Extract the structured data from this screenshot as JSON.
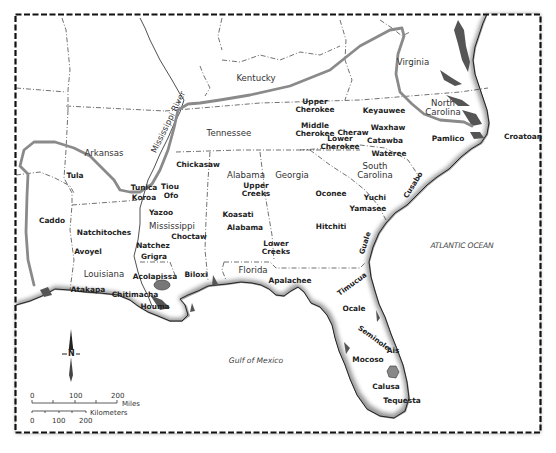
{
  "map": {
    "title": "",
    "states": [
      {
        "id": "kentucky",
        "label": "Kentucky",
        "x": 256,
        "y": 78
      },
      {
        "id": "virginia",
        "label": "Virginia",
        "x": 413,
        "y": 62
      },
      {
        "id": "tennessee",
        "label": "Tennessee",
        "x": 229,
        "y": 133
      },
      {
        "id": "north-carolina",
        "label": "North\nCarolina",
        "x": 443,
        "y": 108
      },
      {
        "id": "arkansas",
        "label": "Arkansas",
        "x": 104,
        "y": 153
      },
      {
        "id": "alabama-state",
        "label": "Alabama",
        "x": 246,
        "y": 175
      },
      {
        "id": "georgia",
        "label": "Georgia",
        "x": 292,
        "y": 175
      },
      {
        "id": "south-carolina",
        "label": "South\nCarolina",
        "x": 375,
        "y": 171
      },
      {
        "id": "mississippi",
        "label": "Mississippi",
        "x": 172,
        "y": 226
      },
      {
        "id": "louisiana",
        "label": "Louisiana",
        "x": 104,
        "y": 274
      },
      {
        "id": "florida-state",
        "label": "Florida",
        "x": 253,
        "y": 270
      }
    ],
    "tribes": [
      {
        "id": "upper-cherokee",
        "label": "Upper\nCherokee",
        "x": 315,
        "y": 106
      },
      {
        "id": "middle-cherokee",
        "label": "Middle\nCherokee",
        "x": 315,
        "y": 130
      },
      {
        "id": "keyauwee",
        "label": "Keyauwee",
        "x": 384,
        "y": 111
      },
      {
        "id": "waxhaw",
        "label": "Waxhaw",
        "x": 388,
        "y": 128
      },
      {
        "id": "cheraw",
        "label": "Cheraw",
        "x": 353,
        "y": 133
      },
      {
        "id": "catawba",
        "label": "Catawba",
        "x": 385,
        "y": 141
      },
      {
        "id": "lower-cherokee",
        "label": "Lower\nCherokee",
        "x": 340,
        "y": 143
      },
      {
        "id": "wateree",
        "label": "Wateree",
        "x": 389,
        "y": 154
      },
      {
        "id": "pamlico",
        "label": "Pamlico",
        "x": 448,
        "y": 139
      },
      {
        "id": "croatoan",
        "label": "Croatoan",
        "x": 523,
        "y": 137
      },
      {
        "id": "chickasaw",
        "label": "Chickasaw",
        "x": 198,
        "y": 165
      },
      {
        "id": "tula",
        "label": "Tula",
        "x": 75,
        "y": 176
      },
      {
        "id": "tunica",
        "label": "Tunica",
        "x": 144,
        "y": 188
      },
      {
        "id": "tiou",
        "label": "Tiou",
        "x": 170,
        "y": 187
      },
      {
        "id": "koroa",
        "label": "Koroa",
        "x": 144,
        "y": 198
      },
      {
        "id": "ofo",
        "label": "Ofo",
        "x": 171,
        "y": 196
      },
      {
        "id": "upper-creeks",
        "label": "Upper\nCreeks",
        "x": 256,
        "y": 190
      },
      {
        "id": "oconee",
        "label": "Oconee",
        "x": 331,
        "y": 194
      },
      {
        "id": "yuchi",
        "label": "Yuchi",
        "x": 375,
        "y": 198
      },
      {
        "id": "yamasee",
        "label": "Yamasee",
        "x": 368,
        "y": 209
      },
      {
        "id": "yazoo",
        "label": "Yazoo",
        "x": 161,
        "y": 213
      },
      {
        "id": "caddo",
        "label": "Caddo",
        "x": 52,
        "y": 221
      },
      {
        "id": "koasati",
        "label": "Koasati",
        "x": 238,
        "y": 215
      },
      {
        "id": "alabama-tribe",
        "label": "Alabama",
        "x": 245,
        "y": 228
      },
      {
        "id": "hitchiti",
        "label": "Hitchiti",
        "x": 331,
        "y": 227
      },
      {
        "id": "natchitoches",
        "label": "Natchitoches",
        "x": 104,
        "y": 233
      },
      {
        "id": "choctaw",
        "label": "Choctaw",
        "x": 189,
        "y": 237
      },
      {
        "id": "avoyel",
        "label": "Avoyel",
        "x": 88,
        "y": 252
      },
      {
        "id": "natchez",
        "label": "Natchez",
        "x": 153,
        "y": 246
      },
      {
        "id": "lower-creeks",
        "label": "Lower\nCreeks",
        "x": 276,
        "y": 248
      },
      {
        "id": "grigra",
        "label": "Grigra",
        "x": 154,
        "y": 257
      },
      {
        "id": "acolapissa",
        "label": "Acolapissa",
        "x": 155,
        "y": 277
      },
      {
        "id": "biloxi",
        "label": "Biloxi",
        "x": 196,
        "y": 275
      },
      {
        "id": "apalachee",
        "label": "Apalachee",
        "x": 290,
        "y": 281
      },
      {
        "id": "atakapa",
        "label": "Atakapa",
        "x": 88,
        "y": 290
      },
      {
        "id": "chitimacha",
        "label": "Chitimacha",
        "x": 135,
        "y": 295
      },
      {
        "id": "houma",
        "label": "Houma",
        "x": 155,
        "y": 307
      },
      {
        "id": "ocale",
        "label": "Ocale",
        "x": 354,
        "y": 309
      },
      {
        "id": "mocoso",
        "label": "Mocoso",
        "x": 368,
        "y": 360
      },
      {
        "id": "ais",
        "label": "Ais",
        "x": 393,
        "y": 351
      },
      {
        "id": "calusa",
        "label": "Calusa",
        "x": 386,
        "y": 387
      },
      {
        "id": "tequesta",
        "label": "Tequesta",
        "x": 402,
        "y": 401
      }
    ],
    "rotated_labels": [
      {
        "id": "mississippi-river",
        "label": "Mississippi River",
        "x": 168,
        "y": 122,
        "rot": -64,
        "size": 8.2
      },
      {
        "id": "cusabo",
        "label": "Cusabo",
        "x": 413,
        "y": 185,
        "rot": -58,
        "size": 7.2
      },
      {
        "id": "guale",
        "label": "Guale",
        "x": 365,
        "y": 243,
        "rot": -72,
        "size": 7.2
      },
      {
        "id": "timucua",
        "label": "Timucua",
        "x": 352,
        "y": 284,
        "rot": -36,
        "size": 7.2
      },
      {
        "id": "seminole",
        "label": "Seminole",
        "x": 374,
        "y": 338,
        "rot": 36,
        "size": 7.2
      }
    ],
    "water_bodies": [
      {
        "id": "atlantic-ocean",
        "label": "ATLANTIC OCEAN",
        "x": 462,
        "y": 246
      },
      {
        "id": "gulf-of-mexico",
        "label": "Gulf of Mexico",
        "x": 256,
        "y": 361
      }
    ],
    "compass": {
      "label": "N",
      "x": 71,
      "y": 354
    },
    "scale": {
      "miles": {
        "ticks": [
          "0",
          "100",
          "200"
        ],
        "unit": "Miles"
      },
      "kilometers": {
        "ticks": [
          "0",
          "100",
          "200"
        ],
        "unit": "Kilometers"
      }
    },
    "colors": {
      "region_outline": "#8a8a8a",
      "lake_fill": "#7a7a7a",
      "border": "#111111",
      "coast_shadow": "#555555"
    }
  }
}
